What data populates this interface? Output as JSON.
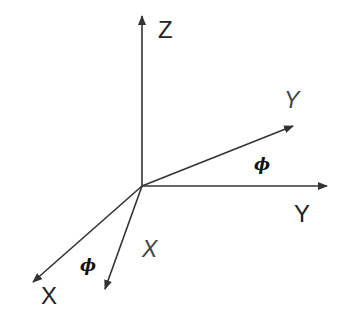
{
  "diagram": {
    "title": "",
    "colors": {
      "line": "#333333",
      "text": "#222222",
      "background": "#ffffff"
    },
    "origin": {
      "x": 142,
      "y": 186
    },
    "axes": [
      {
        "id": "z",
        "label": "Z",
        "style": "upright",
        "tip": {
          "x": 142,
          "y": 15
        }
      },
      {
        "id": "y",
        "label": "Y",
        "style": "upright",
        "tip": {
          "x": 328,
          "y": 186
        }
      },
      {
        "id": "x",
        "label": "X",
        "style": "upright",
        "tip": {
          "x": 32,
          "y": 283
        }
      },
      {
        "id": "y-rotated",
        "label": "Y",
        "style": "italic",
        "tip": {
          "x": 294,
          "y": 126
        }
      },
      {
        "id": "x-rotated",
        "label": "X",
        "style": "italic",
        "tip": {
          "x": 105,
          "y": 290
        }
      }
    ],
    "angles": [
      {
        "id": "phi-y",
        "symbol": "ϕ",
        "between": [
          "y",
          "y-rotated"
        ]
      },
      {
        "id": "phi-x",
        "symbol": "ϕ",
        "between": [
          "x",
          "x-rotated"
        ]
      }
    ]
  }
}
